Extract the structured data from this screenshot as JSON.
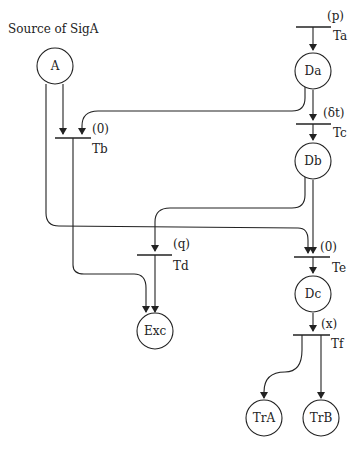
{
  "title": "Source of SigA",
  "places": {
    "A": {
      "label": "A",
      "cx": 55,
      "cy": 68
    },
    "Da": {
      "label": "Da",
      "cx": 313,
      "cy": 72
    },
    "Db": {
      "label": "Db",
      "cx": 313,
      "cy": 162
    },
    "Dc": {
      "label": "Dc",
      "cx": 313,
      "cy": 295
    },
    "Exc": {
      "label": "Exc",
      "cx": 155,
      "cy": 330
    },
    "TrA": {
      "label": "TrA",
      "cx": 265,
      "cy": 418
    },
    "TrB": {
      "label": "TrB",
      "cx": 321,
      "cy": 418
    }
  },
  "transitions": {
    "Ta": {
      "name": "Ta",
      "delay": "(p)"
    },
    "Tb": {
      "name": "Tb",
      "delay": "(0)"
    },
    "Tc": {
      "name": "Tc",
      "delay": "(δt)"
    },
    "Td": {
      "name": "Td",
      "delay": "(q)"
    },
    "Te": {
      "name": "Te",
      "delay": "(0)"
    },
    "Tf": {
      "name": "Tf",
      "delay": "(x)"
    }
  },
  "colors": {
    "stroke": "#222222",
    "background": "#ffffff"
  }
}
